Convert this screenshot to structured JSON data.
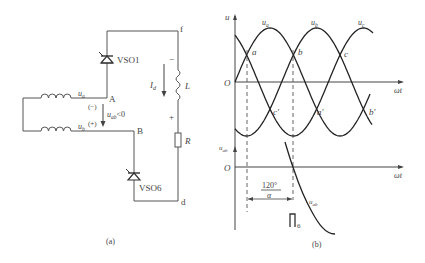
{
  "figure": {
    "panel_a": {
      "caption": "(a)",
      "nodes": {
        "f": "f",
        "A": "A",
        "B": "B",
        "d": "d"
      },
      "thyristor_top": "VSO1",
      "thyristor_bottom": "VSO6",
      "source_a": "u",
      "source_a_sub": "a",
      "source_b": "u",
      "source_b_sub": "b",
      "polarity_top": "(−)",
      "polarity_bottom": "(+)",
      "voltage_label": "u",
      "voltage_sub": "ab",
      "voltage_cond": "<0",
      "current_label": "I",
      "current_sub": "d",
      "inductor_label": "L",
      "resistor_label": "R",
      "L_minus": "−",
      "L_plus": "+"
    },
    "panel_b": {
      "caption": "(b)",
      "y_axis_top": "u",
      "origin_top": "O",
      "x_axis_top": "ωt",
      "phase_labels": {
        "ua": "u",
        "ua_sub": "a",
        "ub": "u",
        "ub_sub": "b",
        "uc": "u",
        "uc_sub": "c"
      },
      "points_upper": [
        "a",
        "b",
        "c"
      ],
      "points_lower": [
        "c′",
        "a′",
        "b′"
      ],
      "y_axis_bottom": "u",
      "y_axis_bottom_sub": "ab",
      "origin_bottom": "O",
      "x_axis_bottom": "ωt",
      "angle_label": "120°",
      "alpha_label": "α",
      "curve_label": "u",
      "curve_label_sub": "ab",
      "pulse_label": "6"
    }
  }
}
